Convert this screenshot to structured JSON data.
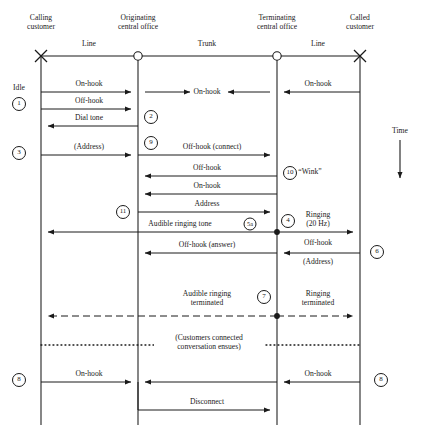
{
  "diagram": {
    "time_label": "Time",
    "columns": [
      {
        "id": "calling",
        "label": "Calling\ncustomer",
        "line1": "Calling",
        "line2": "customer",
        "x": 41,
        "terminal": "cross"
      },
      {
        "id": "originating",
        "label": "Originating\ncentral office",
        "line1": "Originating",
        "line2": "central office",
        "x": 138,
        "terminal": "circle"
      },
      {
        "id": "terminating",
        "label": "Terminating\ncentral office",
        "line1": "Terminating",
        "line2": "central office",
        "x": 277,
        "terminal": "circle"
      },
      {
        "id": "called",
        "label": "Called\ncustomer",
        "line1": "Called",
        "line2": "customer",
        "x": 360,
        "terminal": "cross"
      }
    ],
    "segments": [
      {
        "id": "line-left",
        "label": "Line",
        "x": 89
      },
      {
        "id": "trunk",
        "label": "Trunk",
        "x": 207
      },
      {
        "id": "line-right",
        "label": "Line",
        "x": 318
      }
    ],
    "messages": [
      {
        "id": "on-hook-line-left",
        "label": "On-hook",
        "x": 89,
        "y": 84
      },
      {
        "id": "on-hook-trunk",
        "label": "On-hook",
        "x": 207,
        "y": 88
      },
      {
        "id": "on-hook-line-right",
        "label": "On-hook",
        "x": 318,
        "y": 84
      },
      {
        "id": "off-hook-1",
        "label": "Off-hook",
        "x": 89,
        "y": 101
      },
      {
        "id": "dial-tone",
        "label": "Dial tone",
        "x": 89,
        "y": 118
      },
      {
        "id": "address-1",
        "label": "(Address)",
        "x": 89,
        "y": 147
      },
      {
        "id": "off-hook-connect",
        "label": "Off-hook (connect)",
        "x": 212,
        "y": 143
      },
      {
        "id": "off-hook-wink",
        "label": "Off-hook",
        "x": 207,
        "y": 168
      },
      {
        "id": "wink",
        "label": "“Wink”",
        "x": 308,
        "y": 172
      },
      {
        "id": "on-hook-wink",
        "label": "On-hook",
        "x": 207,
        "y": 186
      },
      {
        "id": "address-2",
        "label": "Address",
        "x": 207,
        "y": 204
      },
      {
        "id": "audible-ringing-tone",
        "label": "Audible ringing tone",
        "x": 180,
        "y": 224
      },
      {
        "id": "ringing-20hz",
        "label": "Ringing\n(20 Hz)",
        "x": 318,
        "y": 218
      },
      {
        "id": "off-hook-answer",
        "label": "Off-hook (answer)",
        "x": 207,
        "y": 245
      },
      {
        "id": "off-hook-right",
        "label": "Off-hook",
        "x": 318,
        "y": 243
      },
      {
        "id": "address-3",
        "label": "(Address)",
        "x": 318,
        "y": 262
      },
      {
        "id": "audible-ringing-terminated",
        "label": "Audible ringing\nterminated",
        "x": 207,
        "y": 294
      },
      {
        "id": "ringing-terminated",
        "label": "Ringing\nterminated",
        "x": 318,
        "y": 294
      },
      {
        "id": "customers-connected",
        "label": "(Customers connected\nconversation ensues)",
        "x": 207,
        "y": 338
      },
      {
        "id": "on-hook-final-left",
        "label": "On-hook",
        "x": 89,
        "y": 374
      },
      {
        "id": "on-hook-final-right",
        "label": "On-hook",
        "x": 318,
        "y": 374
      },
      {
        "id": "disconnect",
        "label": "Disconnect",
        "x": 207,
        "y": 402
      }
    ],
    "state_labels": [
      {
        "id": "idle",
        "label": "Idle",
        "x": 19,
        "y": 88
      }
    ],
    "step_markers": [
      {
        "id": "step-1",
        "label": "1",
        "x": 19,
        "y": 104
      },
      {
        "id": "step-2",
        "label": "2",
        "x": 151,
        "y": 117
      },
      {
        "id": "step-9",
        "label": "9",
        "x": 151,
        "y": 143
      },
      {
        "id": "step-3",
        "label": "3",
        "x": 19,
        "y": 153
      },
      {
        "id": "step-10",
        "label": "10",
        "x": 290,
        "y": 173
      },
      {
        "id": "step-11",
        "label": "11",
        "x": 123,
        "y": 212
      },
      {
        "id": "step-5a",
        "label": "5a",
        "x": 250,
        "y": 224
      },
      {
        "id": "step-4",
        "label": "4",
        "x": 288,
        "y": 221
      },
      {
        "id": "step-6",
        "label": "6",
        "x": 377,
        "y": 252
      },
      {
        "id": "step-7",
        "label": "7",
        "x": 264,
        "y": 297
      },
      {
        "id": "step-8l",
        "label": "8",
        "x": 19,
        "y": 380
      },
      {
        "id": "step-8r",
        "label": "8",
        "x": 381,
        "y": 380
      }
    ],
    "colors": {
      "ink": "#1a1a1a",
      "background": "#ffffff"
    }
  }
}
